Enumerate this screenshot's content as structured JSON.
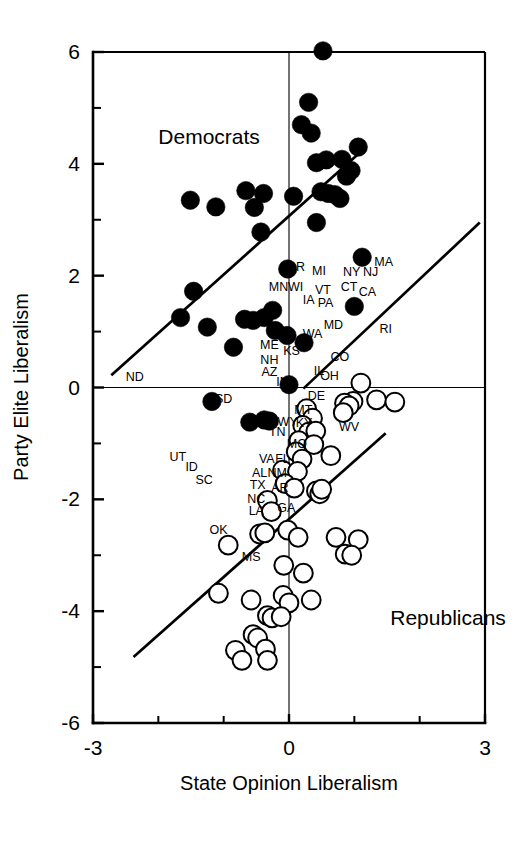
{
  "chart_data": {
    "type": "scatter",
    "title": "",
    "xlabel": "State Opinion Liberalism",
    "ylabel": "Party Elite Liberalism",
    "xlim": [
      -3,
      3
    ],
    "ylim": [
      -6,
      6
    ],
    "xticks": [
      -3,
      0,
      3
    ],
    "xticklabels": [
      "-3",
      "0",
      "3"
    ],
    "xminorticks": [
      -2,
      -1,
      1,
      2
    ],
    "yticks": [
      6,
      4,
      2,
      0,
      -2,
      -4,
      -6
    ],
    "yticklabels": [
      "6",
      "4",
      "2",
      "0",
      "-2",
      "-4",
      "-6"
    ],
    "yminorticks": [
      5,
      3,
      1,
      -1,
      -3,
      -5
    ],
    "grid": false,
    "legend_position": "in-plot-annotations",
    "annotations": [
      {
        "text": "Democrats",
        "x": -2.0,
        "y": 4.35
      },
      {
        "text": "Republicans",
        "x": 1.55,
        "y": -4.25
      }
    ],
    "series": [
      {
        "name": "Democrats",
        "marker": "filled-circle",
        "color": "#000000",
        "points": [
          {
            "x": 0.52,
            "y": 6.02,
            "label": ""
          },
          {
            "x": 0.3,
            "y": 5.1,
            "label": ""
          },
          {
            "x": 0.19,
            "y": 4.7,
            "label": ""
          },
          {
            "x": 0.34,
            "y": 4.55,
            "label": ""
          },
          {
            "x": 1.06,
            "y": 4.3,
            "label": ""
          },
          {
            "x": 0.42,
            "y": 4.02,
            "label": ""
          },
          {
            "x": 0.57,
            "y": 4.07,
            "label": ""
          },
          {
            "x": 0.81,
            "y": 4.08,
            "label": ""
          },
          {
            "x": 0.95,
            "y": 3.88,
            "label": ""
          },
          {
            "x": 0.88,
            "y": 3.78,
            "label": ""
          },
          {
            "x": 0.49,
            "y": 3.5,
            "label": ""
          },
          {
            "x": 0.6,
            "y": 3.47,
            "label": ""
          },
          {
            "x": 0.7,
            "y": 3.45,
            "label": ""
          },
          {
            "x": 0.78,
            "y": 3.38,
            "label": ""
          },
          {
            "x": -0.66,
            "y": 3.52,
            "label": ""
          },
          {
            "x": -0.39,
            "y": 3.47,
            "label": ""
          },
          {
            "x": -1.51,
            "y": 3.35,
            "label": ""
          },
          {
            "x": -1.12,
            "y": 3.23,
            "label": ""
          },
          {
            "x": -0.53,
            "y": 3.22,
            "label": ""
          },
          {
            "x": 0.07,
            "y": 3.42,
            "label": ""
          },
          {
            "x": 0.42,
            "y": 2.95,
            "label": ""
          },
          {
            "x": -0.43,
            "y": 2.78,
            "label": ""
          },
          {
            "x": 1.12,
            "y": 2.33,
            "label": "MA"
          },
          {
            "x": -0.02,
            "y": 2.12,
            "label": "OR"
          },
          {
            "x": -1.46,
            "y": 1.72,
            "label": ""
          },
          {
            "x": 1.0,
            "y": 1.45,
            "label": "CT"
          },
          {
            "x": -1.66,
            "y": 1.25,
            "label": ""
          },
          {
            "x": -0.25,
            "y": 1.38,
            "label": ""
          },
          {
            "x": -0.38,
            "y": 1.25,
            "label": ""
          },
          {
            "x": -0.55,
            "y": 1.2,
            "label": ""
          },
          {
            "x": -0.68,
            "y": 1.22,
            "label": ""
          },
          {
            "x": -1.25,
            "y": 1.08,
            "label": ""
          },
          {
            "x": -0.21,
            "y": 1.02,
            "label": ""
          },
          {
            "x": -0.03,
            "y": 0.93,
            "label": "KS"
          },
          {
            "x": -0.85,
            "y": 0.72,
            "label": ""
          },
          {
            "x": 0.23,
            "y": 0.8,
            "label": "WA"
          },
          {
            "x": 0.0,
            "y": 0.05,
            "label": "IN"
          },
          {
            "x": -1.18,
            "y": -0.25,
            "label": "SD"
          },
          {
            "x": -0.6,
            "y": -0.62,
            "label": ""
          },
          {
            "x": -0.38,
            "y": -0.58,
            "label": ""
          },
          {
            "x": -0.3,
            "y": -0.6,
            "label": ""
          }
        ]
      },
      {
        "name": "Republicans",
        "marker": "open-circle",
        "color": "#ffffff",
        "points": [
          {
            "x": 1.1,
            "y": 0.08,
            "label": ""
          },
          {
            "x": 1.34,
            "y": -0.22,
            "label": ""
          },
          {
            "x": 0.98,
            "y": -0.25,
            "label": ""
          },
          {
            "x": 1.62,
            "y": -0.26,
            "label": ""
          },
          {
            "x": 0.85,
            "y": -0.28,
            "label": ""
          },
          {
            "x": 0.27,
            "y": -0.38,
            "label": ""
          },
          {
            "x": 0.92,
            "y": -0.33,
            "label": ""
          },
          {
            "x": 0.36,
            "y": -0.55,
            "label": ""
          },
          {
            "x": 0.83,
            "y": -0.45,
            "label": ""
          },
          {
            "x": 0.21,
            "y": -0.68,
            "label": ""
          },
          {
            "x": 0.3,
            "y": -0.8,
            "label": ""
          },
          {
            "x": 0.41,
            "y": -0.78,
            "label": ""
          },
          {
            "x": 0.15,
            "y": -0.95,
            "label": ""
          },
          {
            "x": 0.38,
            "y": -1.02,
            "label": ""
          },
          {
            "x": 0.11,
            "y": -1.15,
            "label": ""
          },
          {
            "x": 0.64,
            "y": -1.22,
            "label": ""
          },
          {
            "x": 0.2,
            "y": -1.28,
            "label": ""
          },
          {
            "x": -0.1,
            "y": -1.48,
            "label": ""
          },
          {
            "x": 0.13,
            "y": -1.5,
            "label": ""
          },
          {
            "x": -0.06,
            "y": -1.72,
            "label": ""
          },
          {
            "x": 0.08,
            "y": -1.8,
            "label": ""
          },
          {
            "x": 0.42,
            "y": -1.85,
            "label": ""
          },
          {
            "x": 0.47,
            "y": -1.9,
            "label": ""
          },
          {
            "x": 0.5,
            "y": -1.82,
            "label": ""
          },
          {
            "x": -0.33,
            "y": -2.02,
            "label": "NC"
          },
          {
            "x": -0.27,
            "y": -2.22,
            "label": "LA"
          },
          {
            "x": -0.45,
            "y": -2.62,
            "label": ""
          },
          {
            "x": -0.37,
            "y": -2.6,
            "label": ""
          },
          {
            "x": -0.02,
            "y": -2.55,
            "label": "GA"
          },
          {
            "x": -0.93,
            "y": -2.82,
            "label": "OK"
          },
          {
            "x": 0.14,
            "y": -2.68,
            "label": ""
          },
          {
            "x": 0.72,
            "y": -2.68,
            "label": ""
          },
          {
            "x": 1.06,
            "y": -2.72,
            "label": ""
          },
          {
            "x": 0.86,
            "y": -2.98,
            "label": ""
          },
          {
            "x": 0.96,
            "y": -3.0,
            "label": ""
          },
          {
            "x": -0.08,
            "y": -3.18,
            "label": ""
          },
          {
            "x": 0.22,
            "y": -3.32,
            "label": ""
          },
          {
            "x": -1.08,
            "y": -3.68,
            "label": ""
          },
          {
            "x": -0.58,
            "y": -3.8,
            "label": ""
          },
          {
            "x": -0.09,
            "y": -3.72,
            "label": ""
          },
          {
            "x": 0.0,
            "y": -3.85,
            "label": ""
          },
          {
            "x": 0.34,
            "y": -3.8,
            "label": ""
          },
          {
            "x": -0.33,
            "y": -4.08,
            "label": ""
          },
          {
            "x": -0.26,
            "y": -4.12,
            "label": ""
          },
          {
            "x": -0.12,
            "y": -4.1,
            "label": ""
          },
          {
            "x": -0.55,
            "y": -4.42,
            "label": ""
          },
          {
            "x": -0.48,
            "y": -4.48,
            "label": ""
          },
          {
            "x": -0.82,
            "y": -4.7,
            "label": ""
          },
          {
            "x": -0.72,
            "y": -4.88,
            "label": ""
          },
          {
            "x": -0.36,
            "y": -4.68,
            "label": ""
          },
          {
            "x": -0.33,
            "y": -4.88,
            "label": ""
          }
        ]
      }
    ],
    "fit_lines": [
      {
        "name": "democrat-fit",
        "x0": -2.72,
        "y0": 0.22,
        "x1": 1.18,
        "y1": 4.3
      },
      {
        "name": "republican-fit",
        "x0": -2.38,
        "y0": -4.82,
        "x1": 1.48,
        "y1": -0.82
      },
      {
        "name": "upper-right-fit",
        "x0": 0.22,
        "y0": -0.02,
        "x1": 2.92,
        "y1": 2.95
      }
    ],
    "state_labels": [
      {
        "text": "ND",
        "x": -2.36,
        "y": 0.12
      },
      {
        "text": "OR",
        "x": 0.1,
        "y": 2.08
      },
      {
        "text": "MN",
        "x": -0.16,
        "y": 1.72
      },
      {
        "text": "WI",
        "x": 0.1,
        "y": 1.72
      },
      {
        "text": "MI",
        "x": 0.46,
        "y": 2.02
      },
      {
        "text": "IA",
        "x": 0.3,
        "y": 1.5
      },
      {
        "text": "VT",
        "x": 0.52,
        "y": 1.68
      },
      {
        "text": "PA",
        "x": 0.56,
        "y": 1.44
      },
      {
        "text": "NY",
        "x": 0.96,
        "y": 2.0
      },
      {
        "text": "NJ",
        "x": 1.25,
        "y": 2.0
      },
      {
        "text": "MA",
        "x": 1.45,
        "y": 2.18
      },
      {
        "text": "CT",
        "x": 0.92,
        "y": 1.72
      },
      {
        "text": "CA",
        "x": 1.2,
        "y": 1.64
      },
      {
        "text": "MD",
        "x": 0.68,
        "y": 1.04
      },
      {
        "text": "RI",
        "x": 1.48,
        "y": 0.98
      },
      {
        "text": "WA",
        "x": 0.36,
        "y": 0.88
      },
      {
        "text": "CO",
        "x": 0.78,
        "y": 0.48
      },
      {
        "text": "ME",
        "x": -0.3,
        "y": 0.68
      },
      {
        "text": "KS",
        "x": 0.04,
        "y": 0.58
      },
      {
        "text": "NH",
        "x": -0.3,
        "y": 0.42
      },
      {
        "text": "AZ",
        "x": -0.3,
        "y": 0.2
      },
      {
        "text": "IL",
        "x": 0.46,
        "y": 0.22
      },
      {
        "text": "OH",
        "x": 0.62,
        "y": 0.14
      },
      {
        "text": "IN",
        "x": -0.1,
        "y": 0.02
      },
      {
        "text": "DE",
        "x": 0.42,
        "y": -0.22
      },
      {
        "text": "SD",
        "x": -1.0,
        "y": -0.28
      },
      {
        "text": "MT",
        "x": 0.22,
        "y": -0.48
      },
      {
        "text": "WY",
        "x": -0.02,
        "y": -0.68
      },
      {
        "text": "KY",
        "x": 0.23,
        "y": -0.7
      },
      {
        "text": "TN",
        "x": -0.18,
        "y": -0.86
      },
      {
        "text": "WV",
        "x": 0.92,
        "y": -0.78
      },
      {
        "text": "MO",
        "x": 0.12,
        "y": -1.08
      },
      {
        "text": "UT",
        "x": -1.7,
        "y": -1.32
      },
      {
        "text": "ID",
        "x": -1.49,
        "y": -1.5
      },
      {
        "text": "VA",
        "x": -0.34,
        "y": -1.35
      },
      {
        "text": "FL",
        "x": -0.1,
        "y": -1.35
      },
      {
        "text": "AL",
        "x": -0.45,
        "y": -1.6
      },
      {
        "text": "NM",
        "x": -0.18,
        "y": -1.6
      },
      {
        "text": "SC",
        "x": -1.3,
        "y": -1.72
      },
      {
        "text": "TX",
        "x": -0.48,
        "y": -1.82
      },
      {
        "text": "AR",
        "x": -0.14,
        "y": -1.86
      },
      {
        "text": "NC",
        "x": -0.5,
        "y": -2.06
      },
      {
        "text": "LA",
        "x": -0.5,
        "y": -2.28
      },
      {
        "text": "GA",
        "x": -0.04,
        "y": -2.22
      },
      {
        "text": "OK",
        "x": -1.08,
        "y": -2.62
      },
      {
        "text": "MS",
        "x": -0.58,
        "y": -3.1
      }
    ]
  },
  "axis": {
    "x_title": "State Opinion Liberalism",
    "y_title": "Party Elite Liberalism",
    "x_tick_labels": [
      "-3",
      "0",
      "3"
    ],
    "y_tick_labels": [
      "6",
      "4",
      "2",
      "0",
      "-2",
      "-4",
      "-6"
    ]
  },
  "labels": {
    "democrats": "Democrats",
    "republicans": "Republicans"
  },
  "colors": {
    "ink": "#000000",
    "paper": "#ffffff",
    "democrat_marker": "#000000",
    "republican_marker": "#ffffff"
  }
}
